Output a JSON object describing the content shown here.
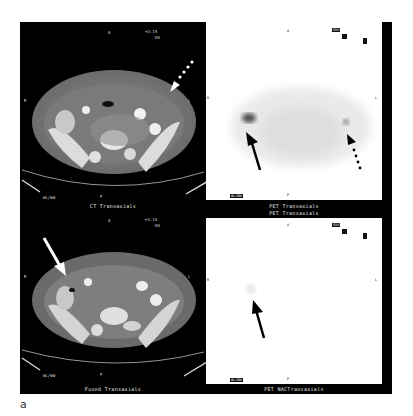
{
  "figure": {
    "letter": "a",
    "panels": [
      {
        "id": "ct",
        "caption": "CT Transaxials",
        "orientation": {
          "top": "A",
          "bottom": "P",
          "left": "R",
          "right": "L"
        },
        "corner_info": {
          "top_right_1": "+2.19",
          "top_right_2": "HU",
          "bottom_left": "WL/WW"
        },
        "arrows": [
          {
            "style": "dotted",
            "color": "#ffffff",
            "target": "left colon lesion"
          }
        ]
      },
      {
        "id": "pet",
        "caption": "PET Transaxials",
        "orientation": {
          "top": "A",
          "bottom": "P",
          "left": "R",
          "right": "L"
        },
        "corner_info": {
          "top_right_1": "SUV",
          "top_right_2": "",
          "bottom_left": "WL/WW"
        },
        "arrows": [
          {
            "style": "solid",
            "color": "#000000",
            "target": "right colon uptake"
          },
          {
            "style": "dotted",
            "color": "#000000",
            "target": "left colon uptake"
          }
        ]
      },
      {
        "id": "fused",
        "caption": "Fused Transaxials",
        "orientation": {
          "top": "A",
          "bottom": "P",
          "left": "R",
          "right": "L"
        },
        "corner_info": {
          "top_right_1": "+2.19",
          "top_right_2": "HU",
          "bottom_left": "WL/WW"
        },
        "arrows": [
          {
            "style": "solid",
            "color": "#ffffff",
            "target": "right colon lesion"
          }
        ]
      },
      {
        "id": "pet-nac",
        "caption": "PET NACTransaxials",
        "orientation": {
          "top": "A",
          "bottom": "P",
          "left": "R",
          "right": "L"
        },
        "corner_info": {
          "top_right_1": "SUV",
          "top_right_2": "",
          "bottom_left": "WL/WW"
        },
        "arrows": [
          {
            "style": "solid",
            "color": "#000000",
            "target": "faint right uptake"
          }
        ]
      }
    ]
  }
}
